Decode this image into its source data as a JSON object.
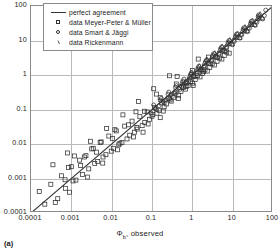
{
  "figure": {
    "caption": "(a)",
    "xtitle_main": "Φ",
    "xtitle_sub": "b",
    "xtitle_rest": ", observed"
  },
  "legend": {
    "items": [
      {
        "symbol": "line",
        "label": "perfect agreement"
      },
      {
        "symbol": "square",
        "label": "data Meyer-Peter & Müller"
      },
      {
        "symbol": "circle",
        "label": "data Smart & Jäggi"
      },
      {
        "symbol": "triangle",
        "label": "data Rickenmann"
      }
    ]
  },
  "axes": {
    "x_ticks": [
      "0.0001",
      "0.001",
      "0.01",
      "0.1",
      "1",
      "10",
      "100"
    ],
    "y_ticks": [
      "100",
      "10",
      "1",
      "0.1",
      "0.01",
      "0.001",
      "0.0001"
    ]
  },
  "colors": {
    "frame": "#8a8a8a",
    "grid": "#b9b9b9",
    "marker": "#333333",
    "line": "#333333",
    "text": "#1c1c1c"
  },
  "chart_data": {
    "type": "scatter",
    "title": "",
    "xlabel": "Φb, observed",
    "ylabel": "Φb, calculated",
    "xscale": "log",
    "yscale": "log",
    "xlim": [
      0.0001,
      100
    ],
    "ylim": [
      0.0001,
      100
    ],
    "xticks": [
      0.0001,
      0.001,
      0.01,
      0.1,
      1,
      10,
      100
    ],
    "yticks": [
      0.0001,
      0.001,
      0.01,
      0.1,
      1,
      10,
      100
    ],
    "grid": true,
    "legend_position": "upper-left",
    "reference_line": {
      "name": "perfect agreement",
      "type": "line",
      "equation": "y = x",
      "points": [
        [
          0.0001,
          0.0001
        ],
        [
          100,
          100
        ]
      ]
    },
    "series": [
      {
        "name": "data Meyer-Peter & Müller",
        "marker": "square",
        "points": [
          [
            0.00016,
            0.00042
          ],
          [
            0.00022,
            0.00018
          ],
          [
            0.00031,
            0.00068
          ],
          [
            0.00046,
            0.00026
          ],
          [
            0.00057,
            0.0012
          ],
          [
            0.00071,
            0.00052
          ],
          [
            0.00085,
            0.0021
          ],
          [
            0.0011,
            0.00085
          ],
          [
            0.0013,
            0.0009
          ],
          [
            0.0016,
            0.0034
          ],
          [
            0.0019,
            0.0013
          ],
          [
            0.0023,
            0.0046
          ],
          [
            0.0027,
            0.0019
          ],
          [
            0.0032,
            0.0072
          ],
          [
            0.0038,
            0.0027
          ],
          [
            0.0045,
            0.0031
          ],
          [
            0.0052,
            0.011
          ],
          [
            0.0061,
            0.0042
          ],
          [
            0.0072,
            0.0049
          ],
          [
            0.0085,
            0.017
          ],
          [
            0.0098,
            0.0062
          ],
          [
            0.011,
            0.0075
          ],
          [
            0.013,
            0.024
          ],
          [
            0.015,
            0.0095
          ],
          [
            0.018,
            0.011
          ],
          [
            0.021,
            0.033
          ],
          [
            0.024,
            0.014
          ],
          [
            0.028,
            0.018
          ],
          [
            0.032,
            0.046
          ],
          [
            0.037,
            0.022
          ],
          [
            0.043,
            0.027
          ],
          [
            0.05,
            0.062
          ],
          [
            0.057,
            0.034
          ],
          [
            0.066,
            0.042
          ],
          [
            0.076,
            0.085
          ],
          [
            0.087,
            0.052
          ],
          [
            0.1,
            0.064
          ],
          [
            0.115,
            0.115
          ],
          [
            0.132,
            0.078
          ],
          [
            0.15,
            0.095
          ],
          [
            0.17,
            0.155
          ],
          [
            0.2,
            0.12
          ],
          [
            0.23,
            0.145
          ],
          [
            0.26,
            0.21
          ],
          [
            0.3,
            0.175
          ],
          [
            0.34,
            0.22
          ],
          [
            0.39,
            0.3
          ],
          [
            0.45,
            0.26
          ],
          [
            0.52,
            0.33
          ],
          [
            0.6,
            0.44
          ],
          [
            0.68,
            0.39
          ],
          [
            0.78,
            0.5
          ],
          [
            0.9,
            0.64
          ],
          [
            1.02,
            0.58
          ],
          [
            1.18,
            0.74
          ],
          [
            1.35,
            0.95
          ],
          [
            1.55,
            0.88
          ],
          [
            1.78,
            1.1
          ],
          [
            2.05,
            1.4
          ],
          [
            2.35,
            1.3
          ],
          [
            2.7,
            1.65
          ],
          [
            3.1,
            2.1
          ],
          [
            3.55,
            1.95
          ],
          [
            4.1,
            2.5
          ],
          [
            4.7,
            3.1
          ],
          [
            5.4,
            2.9
          ],
          [
            6.2,
            3.7
          ],
          [
            7.1,
            4.6
          ],
          [
            8.2,
            4.3
          ],
          [
            0.0004,
            0.0002
          ],
          [
            0.0009,
            0.0004
          ],
          [
            0.0025,
            0.0011
          ],
          [
            0.006,
            0.0028
          ],
          [
            0.014,
            0.0068
          ],
          [
            0.035,
            0.016
          ],
          [
            0.08,
            0.038
          ],
          [
            0.19,
            0.09
          ],
          [
            0.45,
            0.21
          ],
          [
            1.05,
            0.5
          ],
          [
            0.0012,
            0.0045
          ],
          [
            0.003,
            0.012
          ],
          [
            0.0075,
            0.028
          ],
          [
            0.019,
            0.07
          ],
          [
            0.046,
            0.17
          ],
          [
            0.11,
            0.4
          ],
          [
            0.27,
            0.95
          ],
          [
            0.001,
            0.0022
          ],
          [
            0.0035,
            0.0075
          ],
          [
            0.012,
            0.026
          ],
          [
            0.04,
            0.086
          ],
          [
            0.13,
            0.28
          ],
          [
            0.42,
            0.9
          ],
          [
            1.4,
            2.9
          ],
          [
            0.00035,
            0.0025
          ],
          [
            0.0008,
            0.0055
          ],
          [
            0.0021,
            0.0042
          ],
          [
            0.0055,
            0.0115
          ],
          [
            0.016,
            0.0105
          ],
          [
            0.042,
            0.03
          ],
          [
            0.105,
            0.072
          ],
          [
            0.28,
            0.19
          ],
          [
            0.7,
            0.46
          ],
          [
            1.9,
            1.25
          ],
          [
            0.06,
            0.022
          ],
          [
            0.16,
            0.058
          ],
          [
            0.0007,
            0.00092
          ],
          [
            0.0017,
            0.0024
          ],
          [
            0.0042,
            0.0058
          ],
          [
            0.0105,
            0.0145
          ],
          [
            0.026,
            0.036
          ],
          [
            0.065,
            0.089
          ],
          [
            0.16,
            0.22
          ],
          [
            0.4,
            0.55
          ],
          [
            1.0,
            1.35
          ],
          [
            2.5,
            3.3
          ]
        ]
      },
      {
        "name": "data Smart & Jäggi",
        "marker": "circle",
        "points": [
          [
            0.095,
            0.078
          ],
          [
            0.12,
            0.105
          ],
          [
            0.15,
            0.13
          ],
          [
            0.19,
            0.17
          ],
          [
            0.24,
            0.21
          ],
          [
            0.3,
            0.27
          ],
          [
            0.37,
            0.33
          ],
          [
            0.46,
            0.42
          ],
          [
            0.57,
            0.52
          ],
          [
            0.7,
            0.64
          ],
          [
            0.87,
            0.8
          ],
          [
            1.07,
            0.98
          ],
          [
            1.32,
            1.22
          ],
          [
            1.63,
            1.5
          ],
          [
            2.0,
            1.85
          ],
          [
            2.47,
            2.3
          ],
          [
            3.05,
            2.85
          ],
          [
            3.75,
            3.5
          ],
          [
            4.6,
            4.3
          ],
          [
            5.7,
            5.3
          ],
          [
            7.0,
            6.6
          ],
          [
            8.6,
            8.1
          ],
          [
            10.6,
            10.0
          ],
          [
            13.0,
            12.3
          ],
          [
            16.0,
            15.2
          ],
          [
            19.8,
            18.7
          ],
          [
            24.0,
            23.0
          ],
          [
            30.0,
            28.5
          ],
          [
            37.0,
            35.0
          ],
          [
            45.0,
            43.0
          ],
          [
            0.11,
            0.135
          ],
          [
            0.17,
            0.21
          ],
          [
            0.26,
            0.32
          ],
          [
            0.4,
            0.49
          ],
          [
            0.62,
            0.76
          ],
          [
            0.95,
            1.17
          ],
          [
            1.45,
            1.8
          ],
          [
            2.25,
            2.75
          ],
          [
            3.4,
            4.2
          ],
          [
            5.3,
            6.5
          ],
          [
            8.1,
            10.0
          ],
          [
            12.5,
            15.3
          ],
          [
            19.0,
            23.5
          ],
          [
            29.0,
            36.0
          ],
          [
            44.0,
            55.0
          ],
          [
            0.13,
            0.1
          ],
          [
            0.2,
            0.155
          ],
          [
            0.32,
            0.24
          ],
          [
            0.49,
            0.38
          ],
          [
            0.75,
            0.58
          ],
          [
            1.15,
            0.89
          ],
          [
            1.77,
            1.37
          ],
          [
            2.72,
            2.1
          ],
          [
            4.2,
            3.2
          ],
          [
            6.4,
            4.9
          ],
          [
            9.9,
            7.6
          ],
          [
            15.2,
            11.7
          ],
          [
            23.0,
            18.0
          ],
          [
            36.0,
            27.5
          ],
          [
            55.0,
            42.0
          ],
          [
            0.16,
            0.185
          ],
          [
            0.25,
            0.28
          ],
          [
            0.38,
            0.44
          ],
          [
            0.58,
            0.67
          ],
          [
            0.9,
            1.04
          ],
          [
            1.38,
            1.6
          ],
          [
            2.12,
            2.45
          ],
          [
            3.25,
            3.75
          ],
          [
            5.0,
            5.8
          ],
          [
            7.7,
            8.9
          ],
          [
            11.8,
            13.7
          ],
          [
            18.2,
            21.0
          ],
          [
            28.0,
            32.0
          ],
          [
            43.0,
            50.0
          ],
          [
            66.0,
            76.0
          ],
          [
            0.22,
            0.19
          ],
          [
            0.35,
            0.3
          ],
          [
            0.54,
            0.46
          ],
          [
            0.83,
            0.71
          ],
          [
            1.28,
            1.1
          ],
          [
            1.96,
            1.68
          ],
          [
            3.0,
            2.58
          ],
          [
            4.65,
            4.0
          ],
          [
            7.1,
            6.1
          ],
          [
            11.0,
            9.4
          ],
          [
            16.8,
            14.5
          ],
          [
            26.0,
            22.3
          ],
          [
            40.0,
            34.0
          ],
          [
            61.0,
            53.0
          ]
        ]
      },
      {
        "name": "data Rickenmann",
        "marker": "triangle",
        "points": [
          [
            0.55,
            0.6
          ],
          [
            0.85,
            0.92
          ],
          [
            1.3,
            1.42
          ],
          [
            2.0,
            2.2
          ],
          [
            3.1,
            3.4
          ],
          [
            4.8,
            5.2
          ],
          [
            7.4,
            8.0
          ],
          [
            11.4,
            12.4
          ],
          [
            17.5,
            19.0
          ],
          [
            27.0,
            29.5
          ],
          [
            42.0,
            45.0
          ],
          [
            0.7,
            0.58
          ],
          [
            1.1,
            0.9
          ],
          [
            1.7,
            1.4
          ],
          [
            2.6,
            2.15
          ],
          [
            4.0,
            3.3
          ],
          [
            6.2,
            5.1
          ],
          [
            9.6,
            7.9
          ],
          [
            14.8,
            12.2
          ],
          [
            23.0,
            19.0
          ],
          [
            35.0,
            29.0
          ],
          [
            54.0,
            45.0
          ],
          [
            0.95,
            1.15
          ],
          [
            1.5,
            1.8
          ],
          [
            2.3,
            2.8
          ],
          [
            3.6,
            4.3
          ],
          [
            5.5,
            6.7
          ],
          [
            8.5,
            10.3
          ],
          [
            13.2,
            16.0
          ],
          [
            20.3,
            24.5
          ],
          [
            31.0,
            38.0
          ],
          [
            48.0,
            58.0
          ]
        ]
      }
    ]
  }
}
